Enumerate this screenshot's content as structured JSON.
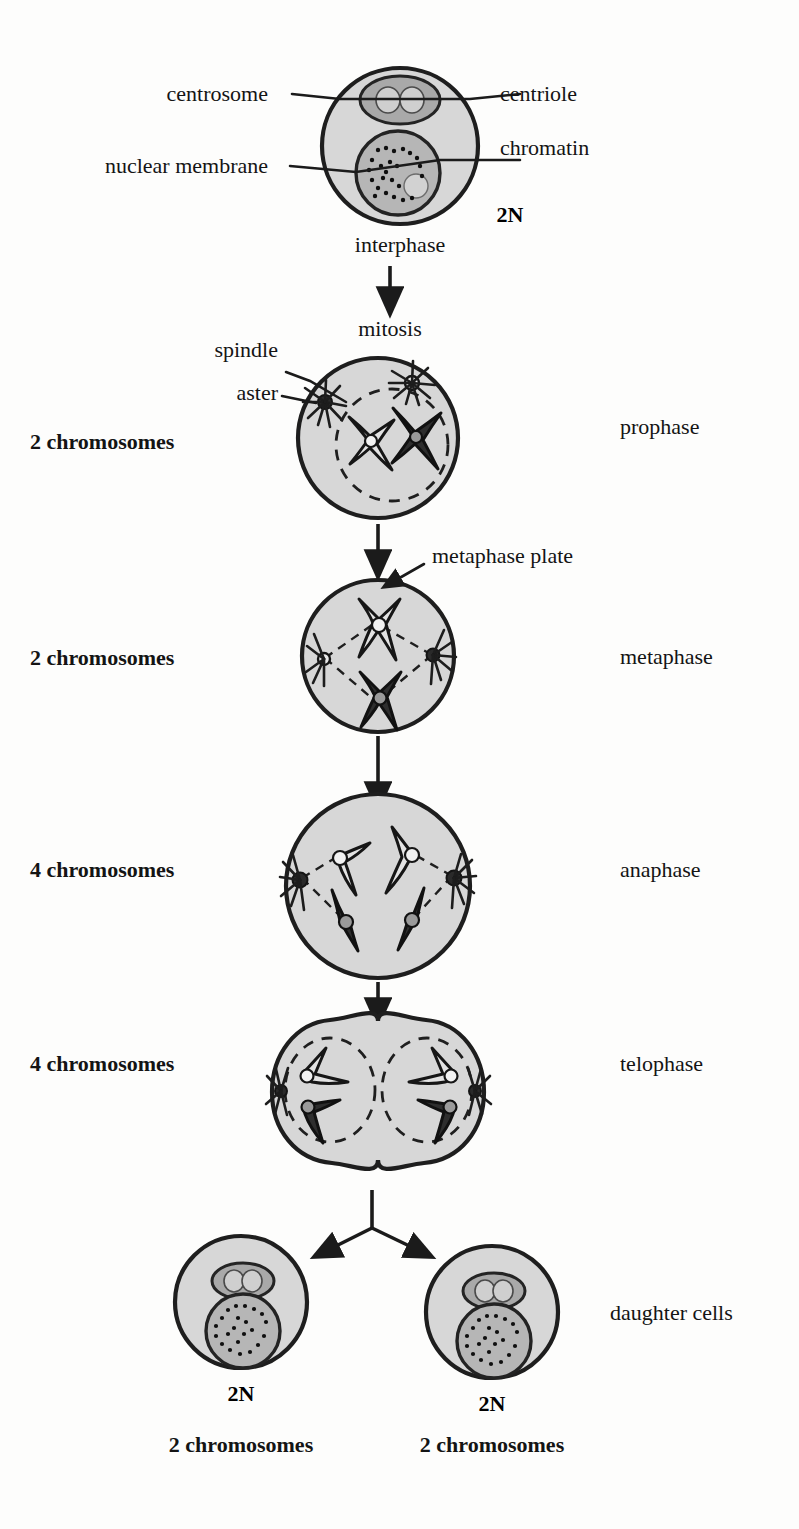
{
  "figure": {
    "type": "biology-process-diagram"
  },
  "annotations": {
    "centrosome": "centrosome",
    "centriole": "centriole",
    "nuclear_membrane": "nuclear membrane",
    "chromatin": "chromatin",
    "spindle": "spindle",
    "aster": "aster",
    "metaphase_plate": "metaphase plate",
    "mitosis": "mitosis"
  },
  "stages": [
    {
      "id": "interphase",
      "phase_label": "interphase",
      "ploidy": "2N",
      "chromosome_count": "",
      "right_label": ""
    },
    {
      "id": "prophase",
      "phase_label": "",
      "ploidy": "",
      "chromosome_count": "2 chromosomes",
      "right_label": "prophase"
    },
    {
      "id": "metaphase",
      "phase_label": "",
      "ploidy": "",
      "chromosome_count": "2 chromosomes",
      "right_label": "metaphase"
    },
    {
      "id": "anaphase",
      "phase_label": "",
      "ploidy": "",
      "chromosome_count": "4 chromosomes",
      "right_label": "anaphase"
    },
    {
      "id": "telophase",
      "phase_label": "",
      "ploidy": "",
      "chromosome_count": "4 chromosomes",
      "right_label": "telophase"
    }
  ],
  "daughter_cells": {
    "group_label": "daughter cells",
    "left": {
      "ploidy": "2N",
      "chromosome_count": "2 chromosomes"
    },
    "right": {
      "ploidy": "2N",
      "chromosome_count": "2 chromosomes"
    }
  },
  "colors": {
    "cytoplasm": "#d7d7d7",
    "nucleus": "#b6b6b6",
    "outline": "#1e1e1e",
    "chromosome_light": "#e3e3e3",
    "chromosome_dark": "#2e2e2e",
    "background": "#fdfdfc"
  }
}
